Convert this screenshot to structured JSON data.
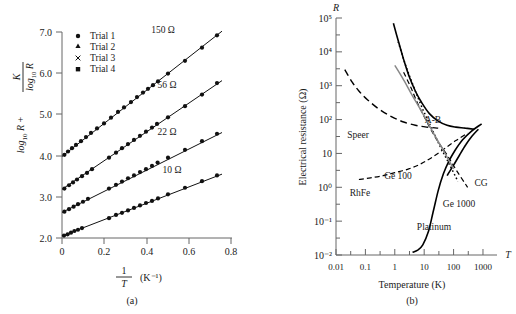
{
  "figure": {
    "panels": [
      {
        "id": "a",
        "caption": "(a)",
        "yaxis_label_parts": {
          "main": "log",
          "sub": "10",
          "var": "R",
          "plus": "+",
          "frac_num": "K",
          "frac_den_main": "log",
          "frac_den_sub": "10",
          "frac_den_var": "R"
        },
        "xaxis_label_parts": {
          "num": "1",
          "den": "T",
          "unit": "(K⁻¹)"
        },
        "ytick_labels": [
          "7.0",
          "6.0",
          "5.0",
          "4.0",
          "3.0",
          "2.0"
        ],
        "ytick_values": [
          7.0,
          6.0,
          5.0,
          4.0,
          3.0,
          2.0
        ],
        "xtick_labels": [
          "0",
          "0.2",
          "0.4",
          "0.6",
          "0.8"
        ],
        "xtick_values": [
          0,
          0.2,
          0.4,
          0.6,
          0.8
        ],
        "legend": [
          {
            "marker": "filled-circle",
            "label": "Trial 1"
          },
          {
            "marker": "filled-triangle",
            "label": "Trial 2"
          },
          {
            "marker": "cross",
            "label": "Trial 3"
          },
          {
            "marker": "filled-square",
            "label": "Trial 4"
          }
        ],
        "series_labels": [
          {
            "text": "150 Ω",
            "x": 0.47,
            "y": 6.55
          },
          {
            "text": "56 Ω",
            "x": 0.47,
            "y": 5.22
          },
          {
            "text": "22 Ω",
            "x": 0.47,
            "y": 4.08
          },
          {
            "text": "10 Ω",
            "x": 0.52,
            "y": 3.17
          }
        ]
      },
      {
        "id": "b",
        "caption": "(b)",
        "yaxis_title": "Electrical resistance (Ω)",
        "yaxis_symbol": "R",
        "xaxis_title": "Temperature (K)",
        "xaxis_symbol": "T",
        "ytick_labels": [
          "10⁵",
          "10⁴",
          "10³",
          "10²",
          "10",
          "10⁰",
          "10⁻¹",
          "10⁻²"
        ],
        "ytick_exponents": [
          5,
          4,
          3,
          2,
          1,
          0,
          -1,
          -2
        ],
        "xtick_labels": [
          "0.01",
          "0.1",
          "1",
          "10",
          "100",
          "1000"
        ],
        "xtick_values": [
          0.01,
          0.1,
          1,
          10,
          100,
          1000
        ],
        "curve_labels": [
          {
            "text": "Speer",
            "x": 22,
            "y": 138
          },
          {
            "text": "A-B",
            "x": 162,
            "y": 123
          },
          {
            "text": "Ge 100",
            "x": 95,
            "y": 179
          },
          {
            "text": "CG",
            "x": 195,
            "y": 186
          },
          {
            "text": "RhFe",
            "x": 27,
            "y": 196
          },
          {
            "text": "Ge 1000",
            "x": 158,
            "y": 207
          },
          {
            "text": "Platinum",
            "x": 128,
            "y": 230
          }
        ]
      }
    ]
  },
  "chart_data": [
    {
      "type": "scatter",
      "panel": "a",
      "title": "",
      "xlabel": "1/T (K⁻¹)",
      "ylabel": "log10 R + K/log10 R",
      "xlim": [
        0,
        0.85
      ],
      "ylim": [
        2.0,
        7.0
      ],
      "grid": false,
      "legend": [
        "Trial 1",
        "Trial 2",
        "Trial 3",
        "Trial 4"
      ],
      "series": [
        {
          "name": "150 Ω",
          "marker": "filled-circle",
          "fit_line": {
            "x": [
              0.0,
              0.8
            ],
            "y": [
              3.98,
              7.02
            ]
          },
          "x": [
            0.012,
            0.03,
            0.05,
            0.07,
            0.095,
            0.12,
            0.145,
            0.175,
            0.21,
            0.245,
            0.28,
            0.31,
            0.345,
            0.375,
            0.405,
            0.43,
            0.455,
            0.48,
            0.53,
            0.615,
            0.7,
            0.775
          ],
          "y": [
            4.02,
            4.1,
            4.18,
            4.26,
            4.35,
            4.45,
            4.55,
            4.66,
            4.78,
            4.92,
            5.06,
            5.17,
            5.3,
            5.42,
            5.53,
            5.62,
            5.71,
            5.8,
            5.99,
            6.3,
            6.62,
            6.92
          ]
        },
        {
          "name": "56 Ω",
          "marker": "filled-circle",
          "fit_line": {
            "x": [
              0.0,
              0.8
            ],
            "y": [
              3.18,
              5.82
            ]
          },
          "x": [
            0.012,
            0.035,
            0.055,
            0.075,
            0.1,
            0.125,
            0.15,
            0.235,
            0.27,
            0.3,
            0.33,
            0.36,
            0.39,
            0.42,
            0.45,
            0.475,
            0.53,
            0.615,
            0.7,
            0.775
          ],
          "y": [
            3.2,
            3.28,
            3.35,
            3.42,
            3.5,
            3.58,
            3.67,
            3.95,
            4.07,
            4.18,
            4.28,
            4.38,
            4.48,
            4.58,
            4.68,
            4.77,
            4.93,
            5.2,
            5.48,
            5.76
          ]
        },
        {
          "name": "22 Ω",
          "marker": "filled-circle",
          "fit_line": {
            "x": [
              0.0,
              0.8
            ],
            "y": [
              2.62,
              4.56
            ]
          },
          "x": [
            0.012,
            0.035,
            0.058,
            0.08,
            0.105,
            0.13,
            0.235,
            0.27,
            0.3,
            0.33,
            0.36,
            0.39,
            0.42,
            0.45,
            0.478,
            0.53,
            0.615,
            0.7,
            0.775
          ],
          "y": [
            2.64,
            2.7,
            2.76,
            2.82,
            2.88,
            2.95,
            3.2,
            3.29,
            3.37,
            3.45,
            3.52,
            3.6,
            3.67,
            3.75,
            3.83,
            3.95,
            4.14,
            4.35,
            4.53
          ]
        },
        {
          "name": "10 Ω",
          "marker": "filled-circle",
          "fit_line": {
            "x": [
              0.0,
              0.8
            ],
            "y": [
              2.05,
              3.55
            ]
          },
          "x": [
            0.01,
            0.028,
            0.045,
            0.062,
            0.08,
            0.1,
            0.235,
            0.27,
            0.3,
            0.33,
            0.36,
            0.39,
            0.42,
            0.45,
            0.48,
            0.53,
            0.615,
            0.7,
            0.775
          ],
          "y": [
            2.06,
            2.09,
            2.13,
            2.17,
            2.2,
            2.24,
            2.48,
            2.56,
            2.61,
            2.67,
            2.73,
            2.79,
            2.85,
            2.9,
            2.96,
            3.06,
            3.22,
            3.38,
            3.52
          ]
        }
      ]
    },
    {
      "type": "line",
      "panel": "b",
      "title": "",
      "xlabel": "Temperature (K)",
      "ylabel": "Electrical resistance (Ω)",
      "xscale": "log",
      "yscale": "log",
      "xlim": [
        0.01,
        3000
      ],
      "ylim": [
        0.01,
        100000
      ],
      "grid": false,
      "series": [
        {
          "name": "A-B",
          "style": "solid",
          "x": [
            0.9,
            1.3,
            2.0,
            3.0,
            5.0,
            8.0,
            15,
            30,
            60,
            120,
            250,
            500
          ],
          "y": [
            70000,
            22000,
            6000,
            2000,
            700,
            330,
            150,
            90,
            68,
            60,
            56,
            52
          ]
        },
        {
          "name": "Speer",
          "style": "dashed",
          "x": [
            0.02,
            0.035,
            0.06,
            0.12,
            0.3,
            0.8,
            2.0,
            5.0,
            12,
            30
          ],
          "y": [
            3000,
            1300,
            700,
            380,
            200,
            120,
            85,
            68,
            60,
            56
          ]
        },
        {
          "name": "Ge 100",
          "style": "dotted",
          "x": [
            1.3,
            2.0,
            3.0,
            5.0,
            9.0,
            18,
            35,
            70,
            140
          ],
          "y": [
            20000,
            6000,
            2200,
            700,
            200,
            55,
            16,
            5.0,
            1.5
          ]
        },
        {
          "name": "Ge 1000",
          "style": "dashed-fine",
          "x": [
            2.0,
            3.5,
            6.0,
            12,
            25,
            60,
            130,
            300
          ],
          "y": [
            2500,
            900,
            300,
            90,
            28,
            9.0,
            3.0,
            1.0
          ]
        },
        {
          "name": "CG",
          "style": "solid",
          "x": [
            60,
            100,
            160,
            260,
            420,
            700
          ],
          "y": [
            2.2,
            4.5,
            9.0,
            18,
            32,
            52
          ]
        },
        {
          "name": "RhFe",
          "style": "dashed-fine",
          "x": [
            0.06,
            0.15,
            0.4,
            1.0,
            3.0,
            8.0,
            20,
            50,
            120,
            300
          ],
          "y": [
            1.7,
            1.9,
            2.2,
            2.7,
            3.5,
            5.0,
            8.0,
            14,
            24,
            40
          ]
        },
        {
          "name": "Platinum",
          "style": "solid",
          "x": [
            4.0,
            6.0,
            9.0,
            14,
            20,
            30,
            45,
            70,
            110,
            200,
            400,
            900
          ],
          "y": [
            0.012,
            0.014,
            0.02,
            0.05,
            0.18,
            0.8,
            2.5,
            6.0,
            12,
            25,
            45,
            75
          ]
        },
        {
          "name": "gray-extra",
          "style": "gray-solid",
          "x": [
            1.0,
            2.0,
            4.0,
            9.0,
            20,
            45,
            100
          ],
          "y": [
            4000,
            1500,
            500,
            150,
            42,
            12,
            3.5
          ]
        }
      ]
    }
  ]
}
